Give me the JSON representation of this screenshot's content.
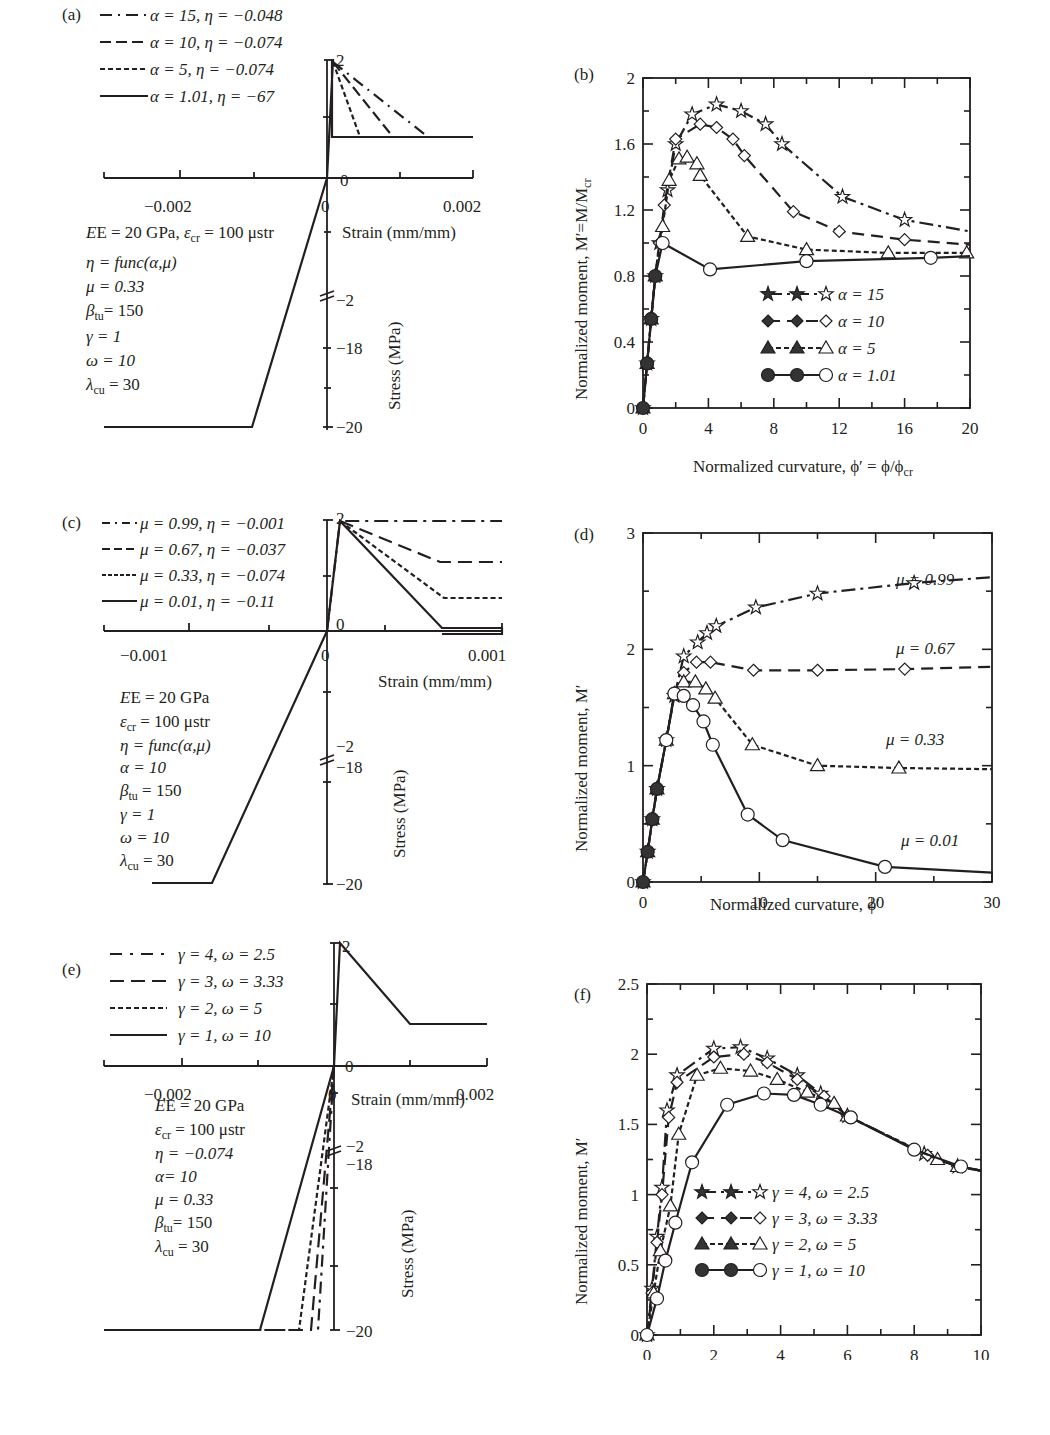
{
  "chart_data": [
    {
      "id": "a",
      "panel_label": "(a)",
      "type": "line",
      "title": "Tensile stress-strain models, varying alpha",
      "xlabel": "Strain (mm/mm)",
      "ylabel": "Stress (MPa)",
      "xlim": [
        -0.003,
        0.002
      ],
      "x_ticks": [
        "-0.002",
        "0",
        "0.002"
      ],
      "y_ticks": [
        "2",
        "0",
        "-2",
        "-18",
        "-20"
      ],
      "legend": [
        {
          "label": "α = 15, η = −0.048",
          "style": "dash-dot"
        },
        {
          "label": "α = 10, η = −0.074",
          "style": "long-dash"
        },
        {
          "label": "α = 5, η = −0.074",
          "style": "short-dash"
        },
        {
          "label": "α = 1.01, η = −67",
          "style": "solid"
        }
      ],
      "parameters": [
        "E = 20 GPa, ε_cr = 100 μstr",
        "η = func(α,μ)",
        "μ = 0.33",
        "β_tu = 150",
        "γ = 1",
        "ω = 10",
        "λ_cu = 30"
      ],
      "series": [
        {
          "name": "α = 15",
          "x": [
            0,
            0.0001,
            0.0015
          ],
          "y": [
            0,
            2,
            0.66
          ]
        },
        {
          "name": "α = 10",
          "x": [
            0,
            0.0001,
            0.001
          ],
          "y": [
            0,
            2,
            0.66
          ]
        },
        {
          "name": "α = 5",
          "x": [
            0,
            0.0001,
            0.0005
          ],
          "y": [
            0,
            2,
            0.66
          ]
        },
        {
          "name": "α = 1.01",
          "x": [
            0,
            0.0001,
            0.000101,
            0.002
          ],
          "y": [
            0,
            2,
            0.66,
            0.66
          ]
        },
        {
          "name": "compression",
          "x": [
            -0.003,
            -0.001,
            0
          ],
          "y": [
            -20,
            -20,
            0
          ]
        }
      ]
    },
    {
      "id": "b",
      "panel_label": "(b)",
      "type": "line",
      "xlabel": "Normalized curvature, ϕ′ = ϕ/ϕcr",
      "ylabel": "Normalized moment, M′=M/Mcr",
      "xlim": [
        0,
        20
      ],
      "ylim": [
        0,
        2
      ],
      "x_ticks": [
        "0",
        "4",
        "8",
        "12",
        "16",
        "20"
      ],
      "y_ticks": [
        "0",
        "0.4",
        "0.8",
        "1.2",
        "1.6",
        "2"
      ],
      "legend": [
        "α = 15",
        "α = 10",
        "α = 5",
        "α = 1.01"
      ],
      "series": [
        {
          "name": "α = 15",
          "marker": "star",
          "x": [
            0,
            0.25,
            0.5,
            0.75,
            1.0,
            1.5,
            2.0,
            3.0,
            4.5,
            6.0,
            7.5,
            8.5,
            12.2,
            16,
            20
          ],
          "y": [
            0,
            0.27,
            0.54,
            0.8,
            1.0,
            1.32,
            1.6,
            1.78,
            1.84,
            1.8,
            1.72,
            1.6,
            1.28,
            1.14,
            1.07
          ]
        },
        {
          "name": "α = 10",
          "marker": "diamond",
          "x": [
            0,
            0.25,
            0.5,
            0.75,
            1.0,
            1.3,
            2.0,
            3.5,
            4.5,
            5.5,
            6.2,
            9.2,
            12,
            16,
            20
          ],
          "y": [
            0,
            0.27,
            0.54,
            0.8,
            1.0,
            1.23,
            1.63,
            1.72,
            1.7,
            1.63,
            1.53,
            1.19,
            1.07,
            1.02,
            0.99
          ]
        },
        {
          "name": "α = 5",
          "marker": "triangle",
          "x": [
            0,
            0.25,
            0.5,
            0.75,
            1.2,
            1.6,
            2.2,
            2.7,
            3.3,
            3.5,
            6.4,
            10,
            15,
            19.8
          ],
          "y": [
            0,
            0.27,
            0.54,
            0.8,
            1.1,
            1.38,
            1.51,
            1.52,
            1.48,
            1.41,
            1.04,
            0.96,
            0.94,
            0.94
          ]
        },
        {
          "name": "α = 1.01",
          "marker": "circle",
          "x": [
            0,
            0.25,
            0.5,
            0.75,
            1.2,
            4.1,
            10,
            17.6,
            20
          ],
          "y": [
            0,
            0.27,
            0.54,
            0.8,
            1.0,
            0.84,
            0.89,
            0.91,
            0.92
          ]
        }
      ]
    },
    {
      "id": "c",
      "panel_label": "(c)",
      "type": "line",
      "xlabel": "Strain (mm/mm)",
      "ylabel": "Stress (MPa)",
      "x_ticks": [
        "-0.001",
        "0",
        "0.001"
      ],
      "y_ticks": [
        "2",
        "0",
        "-2",
        "-18",
        "-20"
      ],
      "legend": [
        {
          "label": "μ = 0.99, η = −0.001",
          "style": "dash-dot"
        },
        {
          "label": "μ = 0.67, η = −0.037",
          "style": "long-dash"
        },
        {
          "label": "μ = 0.33, η = −0.074",
          "style": "short-dash"
        },
        {
          "label": "μ = 0.01, η = −0.11",
          "style": "solid"
        }
      ],
      "parameters": [
        "E = 20 GPa",
        "ε_cr = 100 μstr",
        "η = func(α,μ)",
        "α = 10",
        "β_tu = 150",
        "γ = 1",
        "ω = 10",
        "λ_cu = 30"
      ],
      "series": [
        {
          "name": "μ = 0.99",
          "x": [
            0,
            0.0001,
            0.0015
          ],
          "y": [
            0,
            2,
            1.98
          ]
        },
        {
          "name": "μ = 0.67",
          "x": [
            0,
            0.0001,
            0.0009,
            0.0015
          ],
          "y": [
            0,
            2,
            1.34,
            1.34
          ]
        },
        {
          "name": "μ = 0.33",
          "x": [
            0,
            0.0001,
            0.0009,
            0.0015
          ],
          "y": [
            0,
            2,
            0.66,
            0.66
          ]
        },
        {
          "name": "μ = 0.01",
          "x": [
            0,
            0.0001,
            0.0009,
            0.0015
          ],
          "y": [
            0,
            2,
            0.02,
            0.02
          ]
        },
        {
          "name": "compression",
          "x": [
            -0.0015,
            -0.0012,
            0
          ],
          "y": [
            -20,
            -20,
            0
          ]
        }
      ]
    },
    {
      "id": "d",
      "panel_label": "(d)",
      "type": "line",
      "xlabel": "Normalized curvature, ϕ′",
      "ylabel": "Normalized moment, M′",
      "xlim": [
        0,
        30
      ],
      "ylim": [
        0,
        3
      ],
      "x_ticks": [
        "0",
        "10",
        "20",
        "30"
      ],
      "y_ticks": [
        "0",
        "1",
        "2",
        "3"
      ],
      "annotations": [
        "μ = 0.99",
        "μ = 0.67",
        "μ = 0.33",
        "μ = 0.01"
      ],
      "series": [
        {
          "name": "μ = 0.99",
          "marker": "star",
          "x": [
            0,
            0.4,
            0.8,
            1.2,
            2.0,
            2.7,
            3.5,
            4.7,
            5.5,
            6.3,
            9.7,
            15,
            23.3,
            30
          ],
          "y": [
            0,
            0.26,
            0.54,
            0.8,
            1.22,
            1.6,
            1.94,
            2.06,
            2.14,
            2.2,
            2.36,
            2.48,
            2.57,
            2.62
          ]
        },
        {
          "name": "μ = 0.67",
          "marker": "diamond",
          "x": [
            0,
            0.4,
            0.8,
            1.2,
            2.0,
            2.7,
            3.5,
            4.6,
            5.8,
            9.5,
            15,
            22.5,
            30
          ],
          "y": [
            0,
            0.26,
            0.54,
            0.8,
            1.22,
            1.62,
            1.8,
            1.89,
            1.89,
            1.82,
            1.82,
            1.83,
            1.85
          ]
        },
        {
          "name": "μ = 0.33",
          "marker": "triangle",
          "x": [
            0,
            0.4,
            0.8,
            1.2,
            2.0,
            2.7,
            3.5,
            4.5,
            5.4,
            6.2,
            9.4,
            15,
            22,
            30
          ],
          "y": [
            0,
            0.26,
            0.54,
            0.8,
            1.22,
            1.62,
            1.72,
            1.72,
            1.66,
            1.58,
            1.18,
            1.0,
            0.98,
            0.97
          ]
        },
        {
          "name": "μ = 0.01",
          "marker": "circle",
          "x": [
            0,
            0.4,
            0.8,
            1.2,
            2.0,
            2.7,
            3.5,
            4.3,
            5.2,
            6.0,
            9.0,
            12,
            20.8,
            30
          ],
          "y": [
            0,
            0.26,
            0.54,
            0.8,
            1.22,
            1.62,
            1.6,
            1.52,
            1.38,
            1.18,
            0.58,
            0.36,
            0.13,
            0.08
          ]
        }
      ]
    },
    {
      "id": "e",
      "panel_label": "(e)",
      "type": "line",
      "xlabel": "Strain (mm/mm)",
      "ylabel": "Stress (MPa)",
      "x_ticks": [
        "-0.002",
        "0",
        "0.002"
      ],
      "y_ticks": [
        "2",
        "0",
        "-2",
        "-18",
        "-20"
      ],
      "legend": [
        {
          "label": "γ = 4, ω = 2.5",
          "style": "dash-dot"
        },
        {
          "label": "γ = 3, ω = 3.33",
          "style": "long-dash"
        },
        {
          "label": "γ = 2, ω = 5",
          "style": "short-dash"
        },
        {
          "label": "γ = 1, ω = 10",
          "style": "solid"
        }
      ],
      "parameters": [
        "E = 20 GPa",
        "ε_cr = 100 μstr",
        "η = −0.074",
        "α = 10",
        "μ = 0.33",
        "β_tu = 150",
        "λ_cu = 30"
      ],
      "series": [
        {
          "name": "tension (all)",
          "x": [
            0,
            0.0001,
            0.001,
            0.002
          ],
          "y": [
            0,
            2,
            0.66,
            0.66
          ]
        },
        {
          "name": "γ = 1",
          "x": [
            -0.003,
            -0.0008,
            0
          ],
          "y": [
            -20,
            -20,
            0
          ]
        },
        {
          "name": "γ = 2",
          "x": [
            -0.003,
            -0.0004,
            0
          ],
          "y": [
            -20,
            -20,
            0
          ]
        },
        {
          "name": "γ = 3",
          "x": [
            -0.003,
            -0.00027,
            0
          ],
          "y": [
            -20,
            -20,
            0
          ]
        },
        {
          "name": "γ = 4",
          "x": [
            -0.003,
            -0.0002,
            0
          ],
          "y": [
            -20,
            -20,
            0
          ]
        }
      ]
    },
    {
      "id": "f",
      "panel_label": "(f)",
      "type": "line",
      "xlabel": "Normalized curvature, ϕ′",
      "ylabel": "Normalized moment, M′",
      "xlim": [
        0,
        10
      ],
      "ylim": [
        0,
        2.5
      ],
      "x_ticks": [
        "0",
        "2",
        "4",
        "6",
        "8",
        "10"
      ],
      "y_ticks": [
        "0",
        "0.5",
        "1",
        "1.5",
        "2",
        "2.5"
      ],
      "legend": [
        "γ = 4, ω = 2.5",
        "γ = 3, ω = 3.33",
        "γ = 2, ω = 5",
        "γ = 1, ω = 10"
      ],
      "series": [
        {
          "name": "γ = 4, ω = 2.5",
          "marker": "star",
          "x": [
            0,
            0.15,
            0.3,
            0.45,
            0.6,
            0.9,
            2.0,
            2.8,
            3.6,
            4.5,
            5.2,
            6.0,
            8.3,
            9.3,
            10
          ],
          "y": [
            0,
            0.33,
            0.7,
            1.05,
            1.6,
            1.85,
            2.04,
            2.05,
            1.97,
            1.85,
            1.72,
            1.56,
            1.29,
            1.2,
            1.17
          ]
        },
        {
          "name": "γ = 3, ω = 3.33",
          "marker": "diamond",
          "x": [
            0,
            0.15,
            0.3,
            0.45,
            0.65,
            0.9,
            2.0,
            2.9,
            3.6,
            4.5,
            5.3,
            6.0,
            8.4,
            9.3,
            10
          ],
          "y": [
            0,
            0.3,
            0.66,
            1.0,
            1.55,
            1.8,
            1.98,
            2.0,
            1.94,
            1.82,
            1.7,
            1.56,
            1.28,
            1.2,
            1.17
          ]
        },
        {
          "name": "γ = 2, ω = 5",
          "marker": "triangle",
          "x": [
            0,
            0.2,
            0.4,
            0.7,
            0.95,
            1.5,
            2.2,
            3.1,
            3.9,
            4.8,
            5.6,
            6.0,
            8.7,
            9.3,
            10
          ],
          "y": [
            0,
            0.3,
            0.6,
            0.92,
            1.43,
            1.85,
            1.9,
            1.88,
            1.82,
            1.73,
            1.65,
            1.56,
            1.25,
            1.2,
            1.17
          ]
        },
        {
          "name": "γ = 1, ω = 10",
          "marker": "circle",
          "x": [
            0,
            0.3,
            0.55,
            0.85,
            1.35,
            2.4,
            3.5,
            4.4,
            5.2,
            6.1,
            8,
            9.4,
            10
          ],
          "y": [
            0,
            0.26,
            0.53,
            0.8,
            1.23,
            1.64,
            1.72,
            1.71,
            1.64,
            1.55,
            1.32,
            1.2,
            1.17
          ]
        }
      ]
    }
  ],
  "panels": {
    "a": {
      "label": "(a)",
      "legend": [
        "α = 15, η = −0.048",
        "α = 10, η = −0.074",
        "α = 5, η = −0.074",
        "α = 1.01, η = −67"
      ],
      "x_ticks": [
        "−0.002",
        "0",
        "0.002"
      ],
      "y_ticks": {
        "top": "2",
        "zero": "0",
        "break_hi": "−2",
        "mid": "−18",
        "bottom": "−20"
      },
      "xlabel": "Strain (mm/mm)",
      "ylabel": "Stress (MPa)",
      "params": {
        "line1_E": "E = 20 GPa, ",
        "line1_eps": "ε",
        "line1_sub": "cr",
        "line1_rest": " = 100 μstr",
        "eta": "η  = func(α,μ)",
        "mu": "μ = 0.33",
        "beta": "β",
        "beta_sub": "tu",
        "beta_val": "= 150",
        "gamma": "γ = 1",
        "omega": "ω = 10",
        "lambda": "λ",
        "lambda_sub": "cu",
        "lambda_val": " = 30"
      }
    },
    "b": {
      "label": "(b)",
      "x_ticks": [
        "0",
        "4",
        "8",
        "12",
        "16",
        "20"
      ],
      "y_ticks": [
        "0",
        "0.4",
        "0.8",
        "1.2",
        "1.6",
        "2"
      ],
      "xlabel": "Normalized curvature, ϕ′ = ϕ/ϕ",
      "xlabel_sub": "cr",
      "ylabel": "Normalized moment, M′=M/M",
      "ylabel_sub": "cr",
      "legend": [
        "α = 15",
        "α = 10",
        "α = 5",
        "α = 1.01"
      ]
    },
    "c": {
      "label": "(c)",
      "legend": [
        "μ = 0.99, η = −0.001",
        "μ = 0.67, η = −0.037",
        "μ = 0.33, η = −0.074",
        "μ = 0.01, η = −0.11"
      ],
      "x_ticks": [
        "−0.001",
        "0",
        "0.001"
      ],
      "y_ticks": {
        "top": "2",
        "zero": "0",
        "break_hi": "−2",
        "mid": "−18",
        "bottom": "−20"
      },
      "xlabel": "Strain (mm/mm)",
      "ylabel": "Stress (MPa)",
      "params": {
        "E": "E = 20 GPa",
        "eps": "ε",
        "eps_sub": "cr",
        "eps_val": " = 100 μstr",
        "eta": "η  = func(α,μ)",
        "alpha": "α = 10",
        "beta": "β",
        "beta_sub": "tu",
        "beta_val": " = 150",
        "gamma": "γ = 1",
        "omega": "ω = 10",
        "lambda": "λ",
        "lambda_sub": "cu",
        "lambda_val": " = 30"
      }
    },
    "d": {
      "label": "(d)",
      "x_ticks": [
        "0",
        "10",
        "20",
        "30"
      ],
      "y_ticks": [
        "0",
        "1",
        "2",
        "3"
      ],
      "xlabel": "Normalized curvature, ϕ′",
      "ylabel": "Normalized moment, M′",
      "annotations": [
        "μ = 0.99",
        "μ = 0.67",
        "μ = 0.33",
        "μ = 0.01"
      ]
    },
    "e": {
      "label": "(e)",
      "legend": [
        "γ = 4, ω = 2.5",
        "γ = 3, ω = 3.33",
        "γ = 2, ω = 5",
        "γ = 1, ω = 10"
      ],
      "x_ticks": [
        "−0.002",
        "0",
        "0.002"
      ],
      "y_ticks": {
        "top": "2",
        "zero": "0",
        "break_hi": "−2",
        "mid": "−18",
        "bottom": "−20"
      },
      "xlabel": "Strain (mm/mm)",
      "ylabel": "Stress (MPa)",
      "params": {
        "E": "E = 20 GPa",
        "eps": "ε",
        "eps_sub": "cr",
        "eps_val": " = 100 μstr",
        "eta": "η  = −0.074",
        "alpha": "α= 10",
        "mu": "μ = 0.33",
        "beta": "β",
        "beta_sub": "tu",
        "beta_val": "= 150",
        "lambda": "λ",
        "lambda_sub": "cu",
        "lambda_val": " = 30"
      }
    },
    "f": {
      "label": "(f)",
      "x_ticks": [
        "0",
        "2",
        "4",
        "6",
        "8",
        "10"
      ],
      "y_ticks": [
        "0",
        "0.5",
        "1",
        "1.5",
        "2",
        "2.5"
      ],
      "xlabel": "Normalized curvature, ϕ′",
      "ylabel": "Normalized moment, M′",
      "legend": [
        "γ = 4, ω = 2.5",
        "γ = 3, ω = 3.33",
        "γ = 2, ω = 5",
        "γ = 1, ω = 10"
      ]
    }
  }
}
